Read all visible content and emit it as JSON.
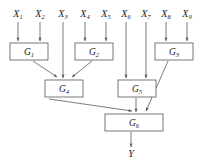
{
  "diagram": {
    "background_color": "#ffffff",
    "line_color": "#5a5a5a",
    "box_stroke_color": "#555555",
    "text_color": "#1a1a1a",
    "inputs": [
      {
        "id": "X1",
        "base": "X",
        "sub": "1",
        "x": 18,
        "label_y": 17
      },
      {
        "id": "X2",
        "base": "X",
        "sub": "2",
        "x": 40,
        "label_y": 17
      },
      {
        "id": "X3",
        "base": "X",
        "sub": "3",
        "x": 63,
        "label_y": 17
      },
      {
        "id": "X4",
        "base": "X",
        "sub": "4",
        "x": 85,
        "label_y": 17
      },
      {
        "id": "X5",
        "base": "X",
        "sub": "5",
        "x": 106,
        "label_y": 17
      },
      {
        "id": "X6",
        "base": "X",
        "sub": "6",
        "x": 126,
        "label_y": 17
      },
      {
        "id": "X7",
        "base": "X",
        "sub": "7",
        "x": 146,
        "label_y": 17
      },
      {
        "id": "X8",
        "base": "X",
        "sub": "8",
        "x": 166,
        "label_y": 17
      },
      {
        "id": "X9",
        "base": "X",
        "sub": "9",
        "x": 187,
        "label_y": 17
      }
    ],
    "nodes": [
      {
        "id": "G1",
        "base": "G",
        "sub": "1",
        "x": 10,
        "y": 43,
        "w": 38,
        "h": 17
      },
      {
        "id": "G2",
        "base": "G",
        "sub": "2",
        "x": 75,
        "y": 43,
        "w": 38,
        "h": 17
      },
      {
        "id": "G3",
        "base": "G",
        "sub": "3",
        "x": 155,
        "y": 43,
        "w": 38,
        "h": 17
      },
      {
        "id": "G4",
        "base": "G",
        "sub": "4",
        "x": 45,
        "y": 80,
        "w": 38,
        "h": 17
      },
      {
        "id": "G5",
        "base": "G",
        "sub": "5",
        "x": 118,
        "y": 80,
        "w": 38,
        "h": 17
      },
      {
        "id": "G6",
        "base": "G",
        "sub": "6",
        "x": 105,
        "y": 114,
        "w": 58,
        "h": 17
      }
    ],
    "output": {
      "id": "Y",
      "base": "Y",
      "sub": "",
      "x": 131,
      "label_y": 157
    },
    "edges": [
      {
        "from": "X1",
        "to": "G1",
        "path": "M18,22 L18,41"
      },
      {
        "from": "X2",
        "to": "G1",
        "path": "M40,22 L40,41"
      },
      {
        "from": "X3",
        "to": "G4",
        "path": "M63,22 L63,78"
      },
      {
        "from": "X4",
        "to": "G2",
        "path": "M85,22 L85,41"
      },
      {
        "from": "X5",
        "to": "G2",
        "path": "M106,22 L106,41"
      },
      {
        "from": "X6",
        "to": "G5",
        "path": "M126,22 L126,78"
      },
      {
        "from": "X7",
        "to": "G5",
        "path": "M146,22 L146,78"
      },
      {
        "from": "X8",
        "to": "G3",
        "path": "M166,22 L166,41"
      },
      {
        "from": "X9",
        "to": "G3",
        "path": "M187,22 L187,41"
      },
      {
        "from": "G1",
        "to": "G4",
        "path": "M33,61 L57,77"
      },
      {
        "from": "G2",
        "to": "G4",
        "path": "M92,61 L72,77"
      },
      {
        "from": "G3",
        "to": "G6",
        "path": "M168,61 L146,111"
      },
      {
        "from": "G4",
        "to": "G6",
        "path": "M49,99 L132,111"
      },
      {
        "from": "G5",
        "to": "G6",
        "path": "M136,98 L136,112"
      },
      {
        "from": "G6",
        "to": "Y",
        "path": "M131,132 L131,147"
      }
    ]
  }
}
